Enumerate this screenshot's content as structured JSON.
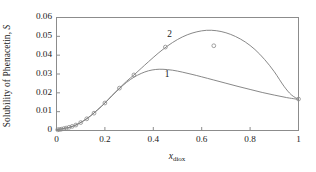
{
  "chart_data": {
    "type": "line",
    "title": "",
    "xlabel": "x_diox",
    "xlabel_base": "x",
    "xlabel_sub": "diox",
    "ylabel": "Solubility of Phenacetin, S",
    "ylabel_base": "Solubility of Phenacetin, ",
    "ylabel_symbol": "S",
    "xlim": [
      0,
      1
    ],
    "ylim": [
      0,
      0.06
    ],
    "xticks": [
      0,
      0.2,
      0.4,
      0.6,
      0.8,
      1
    ],
    "xticklabels": [
      "0",
      "0.2",
      "0.4",
      "0.6",
      "0.8",
      "1"
    ],
    "yticks": [
      0,
      0.01,
      0.02,
      0.03,
      0.04,
      0.05,
      0.06
    ],
    "yticklabels": [
      "0",
      "0.01",
      "0.02",
      "0.03",
      "0.04",
      "0.05",
      "0.06"
    ],
    "grid": false,
    "legend": "inline-curve-labels",
    "frame": "box",
    "line_color": "#7a7a7a",
    "marker_color": "#8a8a8a",
    "marker": "open-circle",
    "annotations": [
      {
        "text": "1",
        "x": 0.46,
        "y": 0.0295,
        "name": "curve-1-label"
      },
      {
        "text": "2",
        "x": 0.47,
        "y": 0.0505,
        "name": "curve-2-label"
      }
    ],
    "series": [
      {
        "name": "1",
        "label": "1",
        "kind": "line",
        "x": [
          0,
          0.02,
          0.05,
          0.08,
          0.11,
          0.14,
          0.17,
          0.2,
          0.23,
          0.26,
          0.29,
          0.32,
          0.35,
          0.38,
          0.41,
          0.44,
          0.48,
          0.52,
          0.56,
          0.6,
          0.65,
          0.7,
          0.75,
          0.8,
          0.85,
          0.9,
          0.95,
          1.0
        ],
        "y": [
          0.0004,
          0.0008,
          0.0016,
          0.0029,
          0.005,
          0.0077,
          0.011,
          0.0146,
          0.0186,
          0.0223,
          0.0256,
          0.0283,
          0.0303,
          0.0317,
          0.0324,
          0.0325,
          0.032,
          0.031,
          0.0298,
          0.0285,
          0.0268,
          0.0251,
          0.0234,
          0.0218,
          0.0202,
          0.0188,
          0.0175,
          0.0165
        ]
      },
      {
        "name": "2",
        "label": "2",
        "kind": "line",
        "x": [
          0,
          0.02,
          0.05,
          0.08,
          0.11,
          0.14,
          0.17,
          0.2,
          0.23,
          0.26,
          0.29,
          0.32,
          0.35,
          0.38,
          0.42,
          0.46,
          0.5,
          0.54,
          0.58,
          0.62,
          0.66,
          0.7,
          0.74,
          0.78,
          0.82,
          0.86,
          0.9,
          0.94,
          0.97,
          1.0
        ],
        "y": [
          0.0004,
          0.0008,
          0.0016,
          0.0029,
          0.005,
          0.0077,
          0.011,
          0.0146,
          0.0186,
          0.0225,
          0.0262,
          0.0295,
          0.033,
          0.0365,
          0.041,
          0.045,
          0.0483,
          0.0508,
          0.0524,
          0.0532,
          0.053,
          0.0519,
          0.0499,
          0.047,
          0.043,
          0.0377,
          0.0312,
          0.0235,
          0.019,
          0.0165
        ]
      },
      {
        "name": "experimental-points",
        "label": "experimental data",
        "kind": "scatter",
        "x": [
          0.005,
          0.012,
          0.02,
          0.03,
          0.04,
          0.052,
          0.065,
          0.08,
          0.1,
          0.125,
          0.155,
          0.2,
          0.26,
          0.32,
          0.45,
          0.65,
          1.0
        ],
        "y": [
          0.0004,
          0.0005,
          0.0007,
          0.001,
          0.0013,
          0.0017,
          0.0022,
          0.0029,
          0.0042,
          0.0062,
          0.0092,
          0.0146,
          0.0225,
          0.0295,
          0.0443,
          0.045,
          0.0167
        ]
      }
    ]
  }
}
